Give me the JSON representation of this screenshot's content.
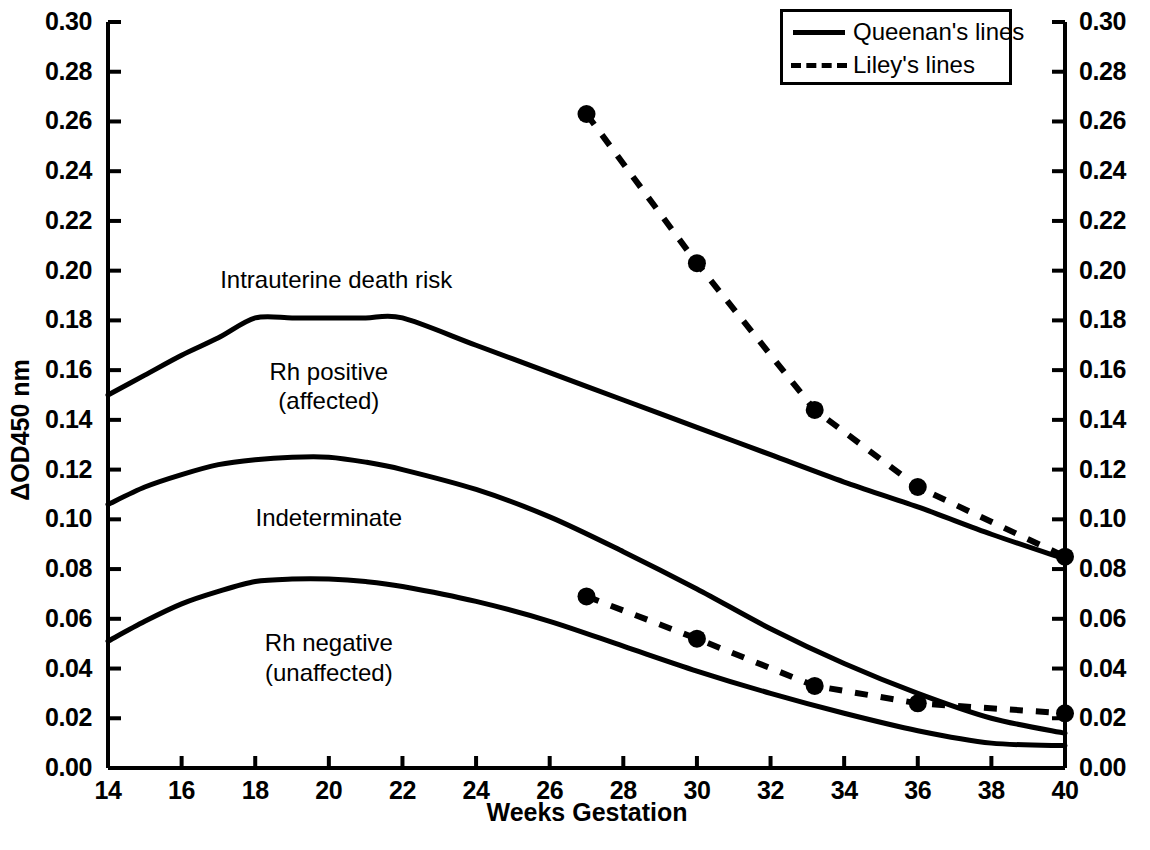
{
  "chart_data": {
    "type": "line",
    "title": "",
    "xlabel": "Weeks Gestation",
    "ylabel": "ΔOD450 nm",
    "ylabel_right": "ΔOD450 nm",
    "xlim": [
      14,
      40
    ],
    "ylim": [
      0.0,
      0.3
    ],
    "grid": false,
    "legend_position": "top-right",
    "xticks": [
      14,
      16,
      18,
      20,
      22,
      24,
      26,
      28,
      30,
      32,
      34,
      36,
      38,
      40
    ],
    "xtick_labels": [
      "14",
      "16",
      "18",
      "20",
      "22",
      "24",
      "26",
      "28",
      "30",
      "32",
      "34",
      "36",
      "38",
      "40"
    ],
    "yticks": [
      0.0,
      0.02,
      0.04,
      0.06,
      0.08,
      0.1,
      0.12,
      0.14,
      0.16,
      0.18,
      0.2,
      0.22,
      0.24,
      0.26,
      0.28,
      0.3
    ],
    "ytick_labels": [
      "0.00",
      "0.02",
      "0.04",
      "0.06",
      "0.08",
      "0.10",
      "0.12",
      "0.14",
      "0.16",
      "0.18",
      "0.20",
      "0.22",
      "0.24",
      "0.26",
      "0.28",
      "0.30"
    ],
    "ytick_labels_right": [
      "0.00",
      "0.02",
      "0.04",
      "0.06",
      "0.08",
      "0.10",
      "0.12",
      "0.14",
      "0.16",
      "0.18",
      "0.20",
      "0.22",
      "0.24",
      "0.26",
      "0.28",
      "0.30"
    ],
    "series": [
      {
        "name": "Queenan upper boundary",
        "style": "solid",
        "markers": false,
        "x": [
          14,
          15,
          16,
          17,
          18,
          19,
          20,
          21,
          22,
          24,
          26,
          28,
          30,
          32,
          34,
          36,
          38,
          40
        ],
        "values": [
          0.15,
          0.158,
          0.166,
          0.173,
          0.181,
          0.181,
          0.181,
          0.181,
          0.181,
          0.17,
          0.159,
          0.148,
          0.137,
          0.126,
          0.115,
          0.105,
          0.094,
          0.084
        ]
      },
      {
        "name": "Queenan middle boundary",
        "style": "solid",
        "markers": false,
        "x": [
          14,
          15,
          16,
          17,
          18,
          19,
          20,
          21,
          22,
          24,
          26,
          28,
          30,
          32,
          34,
          36,
          38,
          40
        ],
        "values": [
          0.106,
          0.113,
          0.118,
          0.122,
          0.124,
          0.125,
          0.125,
          0.123,
          0.12,
          0.112,
          0.101,
          0.087,
          0.072,
          0.056,
          0.042,
          0.03,
          0.02,
          0.014
        ]
      },
      {
        "name": "Queenan lower boundary",
        "style": "solid",
        "markers": false,
        "x": [
          14,
          15,
          16,
          17,
          18,
          19,
          20,
          21,
          22,
          24,
          26,
          28,
          30,
          32,
          34,
          36,
          38,
          40
        ],
        "values": [
          0.051,
          0.059,
          0.066,
          0.071,
          0.075,
          0.076,
          0.076,
          0.075,
          0.073,
          0.067,
          0.059,
          0.049,
          0.039,
          0.03,
          0.022,
          0.015,
          0.01,
          0.009
        ]
      },
      {
        "name": "Liley upper line",
        "style": "dashed",
        "markers": true,
        "x": [
          27,
          30,
          33.2,
          36,
          40
        ],
        "values": [
          0.263,
          0.203,
          0.144,
          0.113,
          0.085
        ]
      },
      {
        "name": "Liley lower line",
        "style": "dashed",
        "markers": true,
        "x": [
          27,
          30,
          33.2,
          36,
          40
        ],
        "values": [
          0.069,
          0.052,
          0.033,
          0.026,
          0.022
        ]
      }
    ],
    "annotations": [
      {
        "text": "Intrauterine death risk",
        "x": 20.2,
        "y": 0.196,
        "name": "intrauterine-death-risk"
      },
      {
        "text": "Rh positive",
        "x": 20.0,
        "y": 0.159,
        "name": "rh-positive"
      },
      {
        "text": "(affected)",
        "x": 20.0,
        "y": 0.147,
        "name": "rh-positive-sub"
      },
      {
        "text": "Indeterminate",
        "x": 20.0,
        "y": 0.1,
        "name": "indeterminate"
      },
      {
        "text": "Rh negative",
        "x": 20.0,
        "y": 0.05,
        "name": "rh-negative"
      },
      {
        "text": "(unaffected)",
        "x": 20.0,
        "y": 0.038,
        "name": "rh-negative-sub"
      }
    ],
    "legend": [
      {
        "label": "Queenan's lines",
        "style": "solid"
      },
      {
        "label": "Liley's lines",
        "style": "dashed"
      }
    ],
    "colors": {
      "ink": "#000000",
      "background": "#ffffff"
    }
  }
}
